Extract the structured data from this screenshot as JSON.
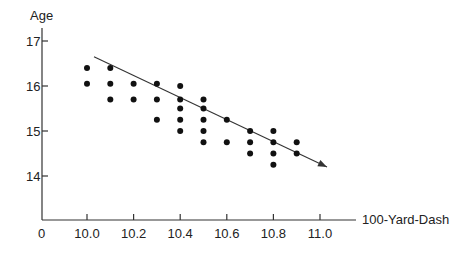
{
  "chart_data": {
    "type": "scatter",
    "title": "",
    "xlabel": "100-Yard-Dash",
    "ylabel": "Age",
    "x_ticks": [
      "0",
      "10.0",
      "10.2",
      "10.4",
      "10.6",
      "10.8",
      "11.0"
    ],
    "y_ticks": [
      "14",
      "15",
      "16",
      "17"
    ],
    "xlim": [
      9.8,
      11.15
    ],
    "ylim": [
      13,
      17.5
    ],
    "grid": false,
    "legend": null,
    "points": [
      {
        "x": 10.0,
        "y": 16.4
      },
      {
        "x": 10.0,
        "y": 16.05
      },
      {
        "x": 10.1,
        "y": 16.4
      },
      {
        "x": 10.1,
        "y": 16.05
      },
      {
        "x": 10.1,
        "y": 15.7
      },
      {
        "x": 10.2,
        "y": 16.05
      },
      {
        "x": 10.2,
        "y": 15.7
      },
      {
        "x": 10.3,
        "y": 16.05
      },
      {
        "x": 10.3,
        "y": 15.7
      },
      {
        "x": 10.3,
        "y": 15.25
      },
      {
        "x": 10.4,
        "y": 16.0
      },
      {
        "x": 10.4,
        "y": 15.7
      },
      {
        "x": 10.4,
        "y": 15.5
      },
      {
        "x": 10.4,
        "y": 15.25
      },
      {
        "x": 10.4,
        "y": 15.0
      },
      {
        "x": 10.5,
        "y": 15.7
      },
      {
        "x": 10.5,
        "y": 15.5
      },
      {
        "x": 10.5,
        "y": 15.25
      },
      {
        "x": 10.5,
        "y": 15.0
      },
      {
        "x": 10.5,
        "y": 14.75
      },
      {
        "x": 10.6,
        "y": 15.25
      },
      {
        "x": 10.6,
        "y": 14.75
      },
      {
        "x": 10.7,
        "y": 15.0
      },
      {
        "x": 10.7,
        "y": 14.75
      },
      {
        "x": 10.7,
        "y": 14.5
      },
      {
        "x": 10.8,
        "y": 15.0
      },
      {
        "x": 10.8,
        "y": 14.75
      },
      {
        "x": 10.8,
        "y": 14.5
      },
      {
        "x": 10.8,
        "y": 14.25
      },
      {
        "x": 10.9,
        "y": 14.75
      },
      {
        "x": 10.9,
        "y": 14.5
      }
    ],
    "trend_line": {
      "from": {
        "x": 10.03,
        "y": 16.65
      },
      "to": {
        "x": 11.03,
        "y": 14.2
      },
      "arrow": true
    }
  }
}
